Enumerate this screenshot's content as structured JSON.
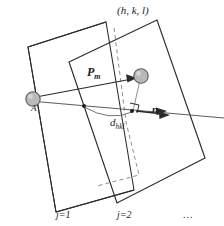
{
  "figure": {
    "type": "crystallography-lattice-plane-diagram",
    "background_color": "#ffffff",
    "line_color": "#2b2b2b",
    "atom_fill": "#b9b9b9",
    "atom_stroke": "#5d5d5d",
    "dash_color": "#8d8d8d"
  },
  "labels": {
    "miller_indices": "(h, k, l)",
    "position_vector": "P",
    "position_vector_sub": "m",
    "normal_vector": "n",
    "interplanar_spacing": "d",
    "interplanar_spacing_sub": "hkl",
    "origin_atom": "A",
    "plane_one": "j=1",
    "plane_two": "j=2",
    "ellipsis": "..."
  },
  "elements": {
    "plane_one_name": "lattice-plane-j1",
    "plane_two_name": "lattice-plane-j2",
    "atom_origin_name": "atom-A",
    "atom_lattice_name": "atom-lattice-point",
    "normal_axis_name": "normal-axis-line",
    "dashed_guide_name": "dashed-projection-guide",
    "right_angle_name": "right-angle-marker",
    "spacing_arc_name": "interplanar-spacing-arc"
  }
}
